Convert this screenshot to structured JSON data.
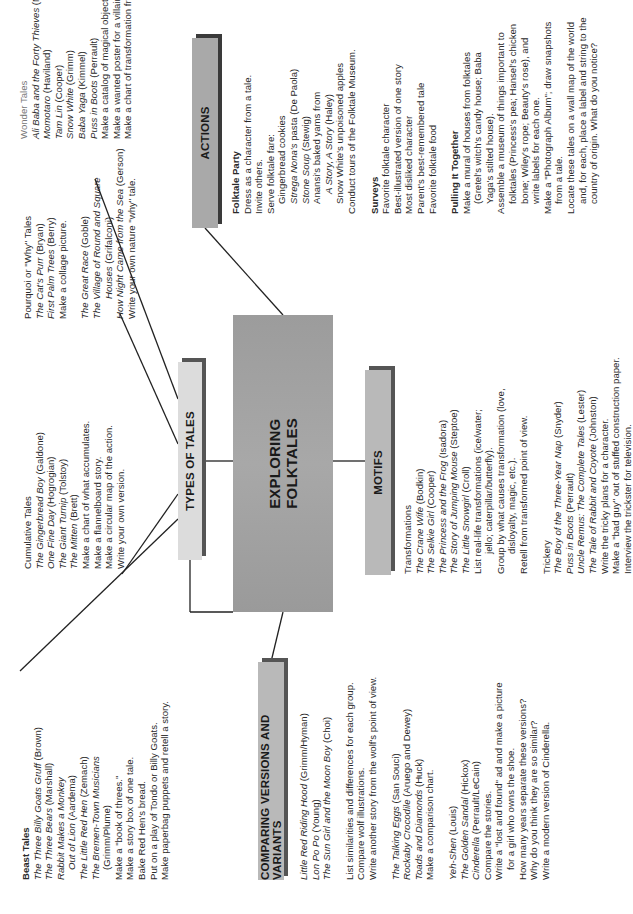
{
  "center": {
    "line1": "EXPLORING",
    "line2": "FOLKTALES"
  },
  "branches": {
    "types": "TYPES OF TALES",
    "comparing": "COMPARING VERSIONS AND VARIANTS",
    "motifs": "MOTIFS",
    "actions": "ACTIONS"
  },
  "beast_tales": {
    "heading": "Beast Tales",
    "lines": [
      [
        "The Three Billy Goats Gruff",
        " (Brown)"
      ],
      [
        "The Three Bears",
        " (Marshall)"
      ],
      [
        "Rabbit Makes a Monkey",
        ""
      ],
      [
        "Out of Lion",
        " (Aardema)"
      ],
      [
        "The Little Red Hen",
        " (Zemach)"
      ],
      [
        "The Bremen-Town Musicians",
        ""
      ],
      [
        "",
        "(Grimm/Plume)"
      ],
      [
        "",
        "Make a \"book of threes.\""
      ],
      [
        "",
        "Make a story box of one tale."
      ],
      [
        "",
        "Bake Red Hen's bread."
      ],
      [
        "",
        "Put on a play of Tondo or Billy Goats."
      ],
      [
        "",
        "Make paperbag puppets and retell a story."
      ]
    ]
  },
  "cumulative_tales": {
    "heading": "Cumulative Tales",
    "lines": [
      [
        "The Gingerbread Boy",
        " (Galdone)"
      ],
      [
        "One Fine Day",
        " (Hogrogian)"
      ],
      [
        "The Giant Turnip",
        " (Tolstoy)"
      ],
      [
        "The Mitten",
        " (Brett)"
      ],
      [
        "",
        "Make a chart of what accumulates."
      ],
      [
        "",
        "Make a flannelboard story."
      ],
      [
        "",
        "Make a circular map of the action."
      ],
      [
        "",
        "Write your own version."
      ]
    ]
  },
  "pourquoi_tales": {
    "heading": "Pourquoi or \"Why\" Tales",
    "lines": [
      [
        "The Cat's Purr",
        " (Bryan)"
      ],
      [
        "First Palm Trees",
        " (Berry)"
      ],
      [
        "",
        "Make a collage picture."
      ],
      [
        "The Great Race",
        " (Goble)"
      ],
      [
        "The Village of Round and Square",
        ""
      ],
      [
        "Houses",
        " (Grifalconi)"
      ],
      [
        "How Night Came from the Sea",
        " (Gerson)"
      ],
      [
        "",
        "Write your own nature \"why\" tale."
      ]
    ]
  },
  "wonder_tales": {
    "heading": "Wonder Tales",
    "lines": [
      [
        "Ali Baba and the Forty Thieves",
        " (McVitty)"
      ],
      [
        "Momotaro",
        " (Haviland)"
      ],
      [
        "Tam Lin",
        " (Cooper)"
      ],
      [
        "Snow White",
        " (Grimm)"
      ],
      [
        "Baba Yaga",
        " (Kimmel)"
      ],
      [
        "Puss in Boots",
        " (Perrault)"
      ],
      [
        "",
        "Make a catalog of magical objects."
      ],
      [
        "",
        "Make a wanted poster for a villain."
      ],
      [
        "",
        "Make a chart of transformation from/to."
      ]
    ]
  },
  "comparing": {
    "red_riding": [
      [
        "Little Red Riding Hood",
        " (Grimm/Hyman)"
      ],
      [
        "Lon Po Po",
        " (Young)"
      ],
      [
        "The Sun Girl and the Moon Boy",
        " (Choi)"
      ]
    ],
    "red_riding_activities": [
      "List similarities and differences for each group.",
      "Compare wolf illustrations.",
      "Write another story from the wolf's point of view."
    ],
    "talking_eggs": [
      [
        "The Talking Eggs",
        " (San Souci)"
      ],
      [
        "Rockaby Crocodile",
        " (Aruego and Dewey)"
      ],
      [
        "Toads and Diamonds",
        " (Huck)"
      ],
      [
        "",
        "Make a comparison chart."
      ]
    ],
    "cinderella": [
      [
        "Yeh-Shen",
        " (Louis)"
      ],
      [
        "The Golden Sandal",
        " (Hickox)"
      ],
      [
        "Cinderella",
        " (Perrault/LeCain)"
      ],
      [
        "",
        "Compare the stories."
      ],
      [
        "",
        "Write a \"lost and found\" ad and make a picture"
      ],
      [
        "",
        "for a girl who owns the shoe."
      ],
      [
        "",
        "How many years separate these versions?"
      ],
      [
        "",
        "Why do you think they are so similar?"
      ],
      [
        "",
        "Write a modern version of Cinderella."
      ]
    ]
  },
  "motifs": {
    "transformations_heading": "Transformations",
    "transformations": [
      [
        "The Crane Wife",
        " (Bodkin)"
      ],
      [
        "The Selkie Girl",
        " (Cooper)"
      ],
      [
        "The Princess and the Frog",
        " (Isadora)"
      ],
      [
        "The Story of Jumping Mouse",
        " (Steptoe)"
      ],
      [
        "The Little Snowgirl",
        " (Croll)"
      ],
      [
        "",
        "List real-life transformations (ice/water;"
      ],
      [
        "",
        "jello; caterpillar/butterfly)."
      ],
      [
        "",
        "Group by what causes transformation (love,"
      ],
      [
        "",
        "disloyalty, magic, etc.)."
      ],
      [
        "",
        "Retell from transformed point of view."
      ]
    ],
    "trickery_heading": "Trickery",
    "trickery": [
      [
        "The Boy of the Three-Year Nap",
        " (Snyder)"
      ],
      [
        "Puss in Boots",
        " (Perrault)"
      ],
      [
        "Uncle Remus: The Complete Tales",
        " (Lester)"
      ],
      [
        "The Tale of Rabbit and Coyote",
        " (Johnston)"
      ],
      [
        "",
        "Write the tricky plans for a character."
      ],
      [
        "",
        "Make a \"bad guy\" out of stuffed construction paper."
      ],
      [
        "",
        "Interview the trickster for television."
      ]
    ]
  },
  "actions": {
    "party_heading": "Folktale Party",
    "party": [
      [
        "",
        "Dress as a character from a tale."
      ],
      [
        "",
        "Invite others."
      ],
      [
        "",
        "Serve folktale fare:"
      ],
      [
        "",
        "Gingerbread cookies"
      ],
      [
        "Strega Nona's",
        " pasta (De Paola)"
      ],
      [
        "Stone Soup",
        " (Stewig)"
      ],
      [
        "",
        "Anansi's baked yams from"
      ],
      [
        "A Story, A Story",
        " (Haley)"
      ],
      [
        "",
        "Snow White's unpoisoned apples"
      ],
      [
        "",
        "Conduct tours of the Folktale Museum."
      ]
    ],
    "surveys_heading": "Surveys",
    "surveys": [
      "Favorite folktale character",
      "Best-illustrated version of one story",
      "Most disliked character",
      "Parent's best-remembered tale",
      "Favorite folktale food"
    ],
    "pulling_heading": "Pulling It Together",
    "pulling": [
      [
        "",
        "Make a mural of houses from folktales"
      ],
      [
        "",
        "(Gretel's witch's candy house; Baba"
      ],
      [
        "",
        "Yaga's stilted house)."
      ],
      [
        "",
        "Assemble a museum of things important to"
      ],
      [
        "",
        "folktales (Princess's pea; Hansel's chicken"
      ],
      [
        "",
        "bone; Wiley's rope; Beauty's rose), and"
      ],
      [
        "",
        "write labels for each one."
      ],
      [
        "",
        "Make a \"Photograph Album\"; draw snapshots"
      ],
      [
        "",
        "from a tale."
      ],
      [
        "",
        "Locate these tales on a wall map of the world"
      ],
      [
        "",
        "and, for each, place a label and string to the"
      ],
      [
        "",
        "country of origin. What do you notice?"
      ]
    ]
  }
}
